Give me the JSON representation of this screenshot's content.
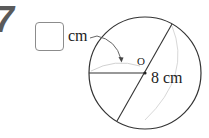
{
  "problem": {
    "number": "7",
    "answer_box": {
      "value": "",
      "unit": "cm"
    },
    "figure": {
      "center_label": "O",
      "given_length_label": "8 cm",
      "shape": "circle",
      "elements": [
        "circle",
        "radius-horizontal-left",
        "diameter-diagonal",
        "curved-arrow-from-unit-to-radius",
        "faint-construction-arcs"
      ]
    }
  },
  "colors": {
    "stroke": "#333333",
    "faint_arc": "#cfcfcf",
    "box_border": "#8c8c8c",
    "number": "#5a5a5a"
  }
}
